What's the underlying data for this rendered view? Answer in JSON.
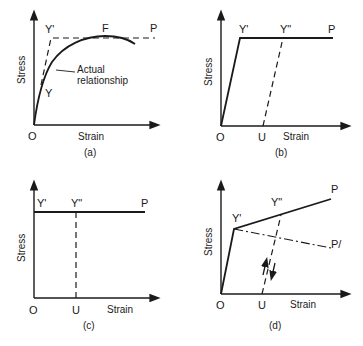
{
  "figure": {
    "panels": [
      {
        "id": "a",
        "caption": "(a)",
        "ylabel": "Stress",
        "xlabel": "Strain",
        "origin_label": "O",
        "points": {
          "Y_prime": "Y'",
          "F": "F",
          "P": "P",
          "Y": "Y"
        },
        "annotation_line1": "Actual",
        "annotation_line2": "relationship"
      },
      {
        "id": "b",
        "caption": "(b)",
        "ylabel": "Stress",
        "xlabel": "Strain",
        "origin_label": "O",
        "points": {
          "Y_prime": "Y'",
          "Y_dprime": "Y\"",
          "P": "P",
          "U": "U"
        }
      },
      {
        "id": "c",
        "caption": "(c)",
        "ylabel": "Stress",
        "xlabel": "Strain",
        "origin_label": "O",
        "points": {
          "Y_prime": "Y'",
          "Y_dprime": "Y\"",
          "P": "P",
          "U": "U"
        }
      },
      {
        "id": "d",
        "caption": "(d)",
        "ylabel": "Stress",
        "xlabel": "Strain",
        "origin_label": "O",
        "points": {
          "Y_prime": "Y'",
          "Y_dprime": "Y\"",
          "P": "P",
          "P_prime": "P/",
          "U": "U"
        }
      }
    ],
    "colors": {
      "ink": "#1a1a1a",
      "background": "#ffffff"
    }
  }
}
